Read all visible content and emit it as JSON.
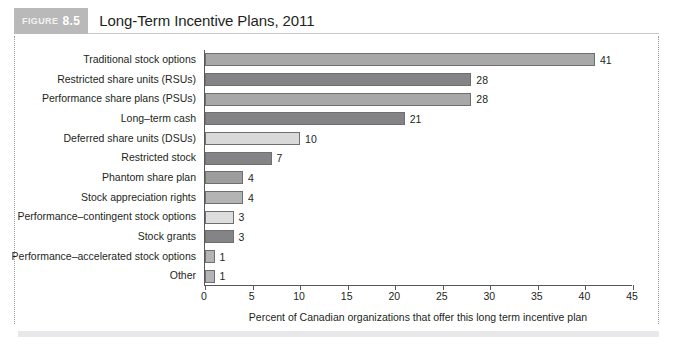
{
  "figure": {
    "tag_word": "FIGURE",
    "tag_number": "8.5",
    "title": "Long-Term Incentive Plans, 2011"
  },
  "chart_data": {
    "type": "bar",
    "orientation": "horizontal",
    "title": "Long-Term Incentive Plans, 2011",
    "xlabel": "Percent of Canadian organizations that offer this long term incentive plan",
    "ylabel": "",
    "xlim": [
      0,
      45
    ],
    "xticks": [
      "0",
      "5",
      "10",
      "15",
      "20",
      "25",
      "30",
      "35",
      "40",
      "45"
    ],
    "xtick_values": [
      0,
      5,
      10,
      15,
      20,
      25,
      30,
      35,
      40,
      45
    ],
    "grid": false,
    "legend": "none",
    "categories": [
      "Traditional stock options",
      "Restricted share units (RSUs)",
      "Performance share plans (PSUs)",
      "Long–term cash",
      "Deferred share units (DSUs)",
      "Restricted stock",
      "Phantom share plan",
      "Stock appreciation rights",
      "Performance–contingent stock options",
      "Stock grants",
      "Performance–accelerated stock options",
      "Other"
    ],
    "values": [
      41,
      28,
      28,
      21,
      10,
      7,
      4,
      4,
      3,
      3,
      1,
      1
    ],
    "value_labels": [
      "41",
      "28",
      "28",
      "21",
      "10",
      "7",
      "4",
      "4",
      "3",
      "3",
      "1",
      "1"
    ],
    "bar_colors": [
      "#a8a8a9",
      "#848486",
      "#a8a8a9",
      "#848486",
      "#d9d9da",
      "#848486",
      "#9d9d9e",
      "#b4b4b5",
      "#dddddd",
      "#848486",
      "#b4b4b5",
      "#b4b4b5"
    ]
  },
  "colors": {
    "tag_background": "#b9b9b9",
    "axis": "#58585a",
    "text": "#231f20",
    "frame_dotted": "#9a9a9a",
    "bottom_rule": "#e8e8ea"
  }
}
